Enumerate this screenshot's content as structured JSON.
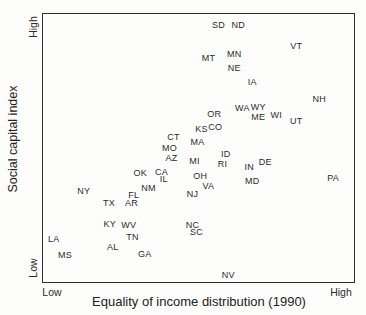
{
  "figure": {
    "y_axis": {
      "title": "Social capital index",
      "top_label": "High",
      "bottom_label": "Low"
    },
    "x_axis": {
      "title": "Equality of income distribution (1990)",
      "left_label": "Low",
      "right_label": "High"
    }
  },
  "colors": {
    "background": "#fdfdfc",
    "text": "#2b2b2b",
    "plot_border": "#2e2e2e"
  },
  "chart_data": {
    "type": "scatter",
    "title": "",
    "xlabel": "Equality of income distribution (1990)",
    "ylabel": "Social capital index",
    "x_axis_range_labels": [
      "Low",
      "High"
    ],
    "y_axis_range_labels": [
      "Low",
      "High"
    ],
    "grid": false,
    "legend": false,
    "marker": "state-abbreviation-text",
    "coordinates_note": "x and y are percentages 0-100 of plot area; y increases upward (social capital), x increases rightward (income equality)",
    "points": [
      {
        "label": "SD",
        "x": 56.4,
        "y": 95.9
      },
      {
        "label": "ND",
        "x": 62.8,
        "y": 95.9
      },
      {
        "label": "VT",
        "x": 81.4,
        "y": 88.1
      },
      {
        "label": "MN",
        "x": 61.5,
        "y": 85.2
      },
      {
        "label": "MT",
        "x": 53.2,
        "y": 83.7
      },
      {
        "label": "NE",
        "x": 61.5,
        "y": 80.0
      },
      {
        "label": "IA",
        "x": 67.3,
        "y": 74.8
      },
      {
        "label": "NH",
        "x": 88.8,
        "y": 68.2
      },
      {
        "label": "WY",
        "x": 69.2,
        "y": 65.2
      },
      {
        "label": "WA",
        "x": 64.1,
        "y": 64.8
      },
      {
        "label": "OR",
        "x": 55.1,
        "y": 62.6
      },
      {
        "label": "WI",
        "x": 75.0,
        "y": 62.2
      },
      {
        "label": "ME",
        "x": 69.2,
        "y": 61.5
      },
      {
        "label": "UT",
        "x": 81.4,
        "y": 60.0
      },
      {
        "label": "CO",
        "x": 55.4,
        "y": 57.8
      },
      {
        "label": "KS",
        "x": 51.0,
        "y": 57.0
      },
      {
        "label": "CT",
        "x": 42.0,
        "y": 54.1
      },
      {
        "label": "MA",
        "x": 49.7,
        "y": 52.2
      },
      {
        "label": "MO",
        "x": 40.7,
        "y": 50.0
      },
      {
        "label": "ID",
        "x": 58.8,
        "y": 47.8
      },
      {
        "label": "AZ",
        "x": 41.3,
        "y": 46.1
      },
      {
        "label": "MI",
        "x": 48.7,
        "y": 45.2
      },
      {
        "label": "DE",
        "x": 71.5,
        "y": 44.8
      },
      {
        "label": "RI",
        "x": 57.7,
        "y": 43.9
      },
      {
        "label": "IN",
        "x": 66.3,
        "y": 43.0
      },
      {
        "label": "CA",
        "x": 38.1,
        "y": 41.1
      },
      {
        "label": "OK",
        "x": 31.3,
        "y": 40.7
      },
      {
        "label": "OH",
        "x": 50.6,
        "y": 39.6
      },
      {
        "label": "PA",
        "x": 93.3,
        "y": 38.9
      },
      {
        "label": "IL",
        "x": 38.8,
        "y": 38.5
      },
      {
        "label": "MD",
        "x": 67.3,
        "y": 37.8
      },
      {
        "label": "VA",
        "x": 53.2,
        "y": 35.9
      },
      {
        "label": "NM",
        "x": 33.9,
        "y": 35.2
      },
      {
        "label": "NY",
        "x": 13.1,
        "y": 34.1
      },
      {
        "label": "NJ",
        "x": 48.1,
        "y": 33.0
      },
      {
        "label": "FL",
        "x": 29.2,
        "y": 32.6
      },
      {
        "label": "AR",
        "x": 28.5,
        "y": 29.6
      },
      {
        "label": "TX",
        "x": 21.2,
        "y": 29.3
      },
      {
        "label": "KY",
        "x": 21.5,
        "y": 21.5
      },
      {
        "label": "NC",
        "x": 48.1,
        "y": 21.1
      },
      {
        "label": "WV",
        "x": 27.6,
        "y": 21.1
      },
      {
        "label": "SC",
        "x": 49.4,
        "y": 18.5
      },
      {
        "label": "TN",
        "x": 28.8,
        "y": 16.7
      },
      {
        "label": "LA",
        "x": 3.5,
        "y": 15.9
      },
      {
        "label": "AL",
        "x": 22.4,
        "y": 13.0
      },
      {
        "label": "GA",
        "x": 32.7,
        "y": 10.4
      },
      {
        "label": "MS",
        "x": 7.1,
        "y": 10.0
      },
      {
        "label": "NV",
        "x": 59.6,
        "y": 2.6
      }
    ]
  }
}
